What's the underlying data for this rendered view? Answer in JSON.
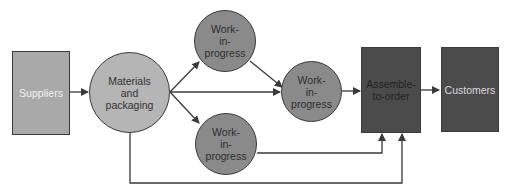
{
  "diagram": {
    "type": "flow",
    "nodes": [
      {
        "id": "suppliers",
        "label": "Suppliers",
        "shape": "rectangle",
        "fill": "#a9a9a9",
        "text_color": "#f2f2f2"
      },
      {
        "id": "materials",
        "label": "Materials\nand\npackaging",
        "shape": "circle",
        "fill": "#b5b5b5",
        "text_color": "#333333"
      },
      {
        "id": "wip_top",
        "label": "Work-\nin-\nprogress",
        "shape": "circle",
        "fill": "#8a8a8a",
        "text_color": "#2e2e2e"
      },
      {
        "id": "wip_mid",
        "label": "Work-\nin-\nprogress",
        "shape": "circle",
        "fill": "#8a8a8a",
        "text_color": "#2e2e2e"
      },
      {
        "id": "wip_bottom",
        "label": "Work-\nin-\nprogress",
        "shape": "circle",
        "fill": "#8a8a8a",
        "text_color": "#2e2e2e"
      },
      {
        "id": "assemble",
        "label": "Assemble-\nto-order",
        "shape": "rectangle",
        "fill": "#4b4b4b",
        "text_color": "#222222"
      },
      {
        "id": "customers",
        "label": "Customers",
        "shape": "rectangle",
        "fill": "#4b4b4b",
        "text_color": "#d9d9d9"
      }
    ],
    "edges": [
      {
        "from": "suppliers",
        "to": "materials"
      },
      {
        "from": "materials",
        "to": "wip_top"
      },
      {
        "from": "materials",
        "to": "wip_mid"
      },
      {
        "from": "materials",
        "to": "wip_bottom"
      },
      {
        "from": "wip_top",
        "to": "wip_mid"
      },
      {
        "from": "wip_mid",
        "to": "assemble"
      },
      {
        "from": "wip_bottom",
        "to": "assemble"
      },
      {
        "from": "materials",
        "to": "assemble"
      },
      {
        "from": "assemble",
        "to": "customers"
      }
    ],
    "colors": {
      "line": "#3a3a3a",
      "border": "#3a3a3a"
    }
  }
}
